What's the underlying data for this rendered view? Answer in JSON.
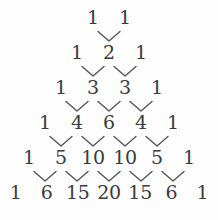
{
  "figure": {
    "name": "pascals-triangle",
    "background_color": "#fefefe",
    "text_color": "#3b3b3b",
    "connector_color": "#555555",
    "connector_icon": "vee-connector-icon"
  },
  "chart_data": {
    "type": "diagram",
    "title": "",
    "xlabel": "",
    "ylabel": "",
    "rows": [
      {
        "index": 0,
        "values": [
          "1",
          "1"
        ]
      },
      {
        "index": 1,
        "values": [
          "1",
          "2",
          "1"
        ]
      },
      {
        "index": 2,
        "values": [
          "1",
          "3",
          "3",
          "1"
        ]
      },
      {
        "index": 3,
        "values": [
          "1",
          "4",
          "6",
          "4",
          "1"
        ]
      },
      {
        "index": 4,
        "values": [
          "1",
          "5",
          "10",
          "10",
          "5",
          "1"
        ]
      },
      {
        "index": 5,
        "values": [
          "1",
          "6",
          "15",
          "20",
          "15",
          "6",
          "1"
        ]
      }
    ],
    "connector_counts": [
      1,
      2,
      3,
      4,
      5
    ],
    "connector_shape": "v"
  }
}
